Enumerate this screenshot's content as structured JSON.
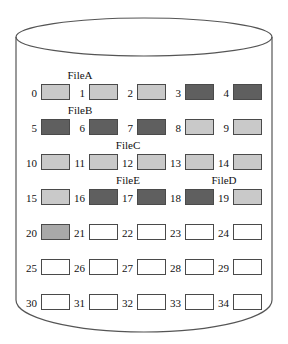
{
  "figure": {
    "name": "disk-cylinder-block-allocation",
    "colors": {
      "background": "#ffffff",
      "outline": "#555555",
      "block_border": "#4a4a4a",
      "light_gray": "#c9c9c9",
      "medium_gray": "#a9a9a9",
      "dark_gray": "#5f5f5f",
      "empty": "#ffffff"
    },
    "geometry": {
      "cylinder_left": 16,
      "cylinder_right": 272,
      "ellipse_top": 18,
      "ellipse_bottom": 56,
      "body_bottom": 300,
      "bottom_curve": 332,
      "columns": 5,
      "rows": 7,
      "col_spacing": 48,
      "row_spacing": 35,
      "grid_origin_x": 24,
      "grid_origin_y": 84
    }
  },
  "blocks": [
    {
      "index": "0",
      "fill": "light"
    },
    {
      "index": "1",
      "fill": "light"
    },
    {
      "index": "2",
      "fill": "light"
    },
    {
      "index": "3",
      "fill": "dark"
    },
    {
      "index": "4",
      "fill": "dark"
    },
    {
      "index": "5",
      "fill": "dark"
    },
    {
      "index": "6",
      "fill": "dark"
    },
    {
      "index": "7",
      "fill": "dark"
    },
    {
      "index": "8",
      "fill": "light"
    },
    {
      "index": "9",
      "fill": "light"
    },
    {
      "index": "10",
      "fill": "light"
    },
    {
      "index": "11",
      "fill": "light"
    },
    {
      "index": "12",
      "fill": "light"
    },
    {
      "index": "13",
      "fill": "light"
    },
    {
      "index": "14",
      "fill": "light"
    },
    {
      "index": "15",
      "fill": "light"
    },
    {
      "index": "16",
      "fill": "dark"
    },
    {
      "index": "17",
      "fill": "dark"
    },
    {
      "index": "18",
      "fill": "dark"
    },
    {
      "index": "19",
      "fill": "light"
    },
    {
      "index": "20",
      "fill": "medium"
    },
    {
      "index": "21",
      "fill": "empty"
    },
    {
      "index": "22",
      "fill": "empty"
    },
    {
      "index": "23",
      "fill": "empty"
    },
    {
      "index": "24",
      "fill": "empty"
    },
    {
      "index": "25",
      "fill": "empty"
    },
    {
      "index": "26",
      "fill": "empty"
    },
    {
      "index": "27",
      "fill": "empty"
    },
    {
      "index": "28",
      "fill": "empty"
    },
    {
      "index": "29",
      "fill": "empty"
    },
    {
      "index": "30",
      "fill": "empty"
    },
    {
      "index": "31",
      "fill": "empty"
    },
    {
      "index": "32",
      "fill": "empty"
    },
    {
      "index": "33",
      "fill": "empty"
    },
    {
      "index": "34",
      "fill": "empty"
    }
  ],
  "file_labels": [
    {
      "label": "FileA",
      "block_index": "1",
      "x": 80,
      "y": 69
    },
    {
      "label": "FileB",
      "block_index": "6",
      "x": 80,
      "y": 104
    },
    {
      "label": "FileC",
      "block_index": "12",
      "x": 128,
      "y": 139
    },
    {
      "label": "FileE",
      "block_index": "17",
      "x": 128,
      "y": 174
    },
    {
      "label": "FileD",
      "block_index": "19",
      "x": 224,
      "y": 174
    }
  ]
}
